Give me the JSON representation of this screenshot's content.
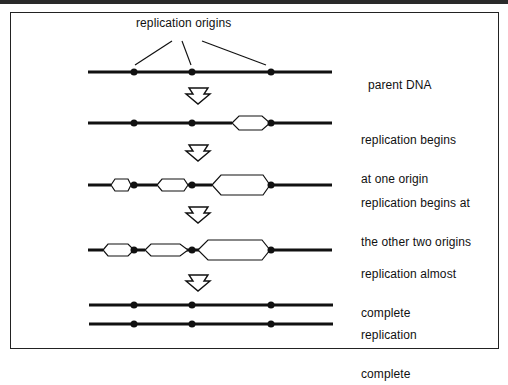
{
  "title_label": "replication origins",
  "stages": [
    {
      "id": "parent",
      "line1": "parent DNA",
      "line2": ""
    },
    {
      "id": "one-origin",
      "line1": "replication begins",
      "line2": "at one origin"
    },
    {
      "id": "two-origins",
      "line1": "replication begins at",
      "line2": "the other two origins"
    },
    {
      "id": "almost",
      "line1": "replication almost",
      "line2": "complete"
    },
    {
      "id": "complete",
      "line1": "replication",
      "line2": "complete"
    }
  ],
  "colors": {
    "line": "#111111",
    "border": "#222222",
    "background": "#ffffff"
  }
}
